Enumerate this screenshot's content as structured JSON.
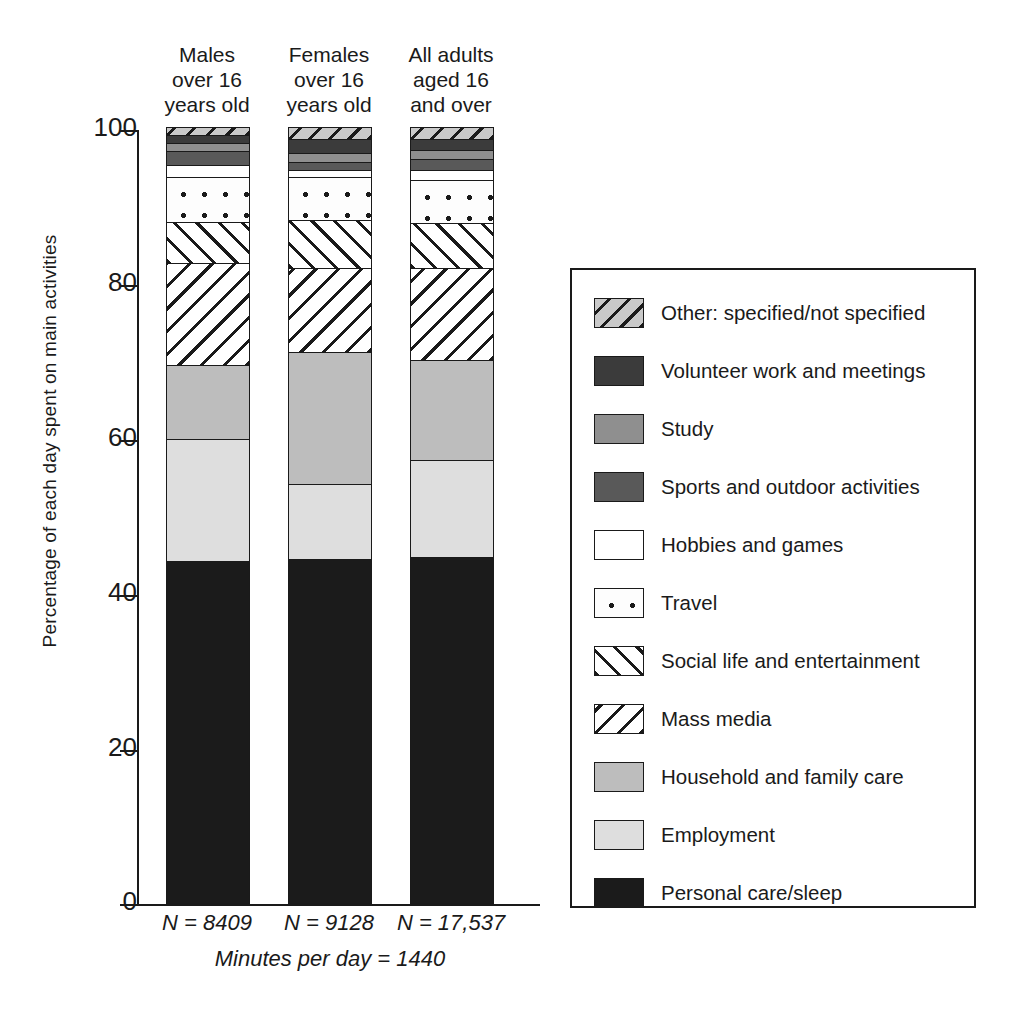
{
  "chart_data": {
    "type": "bar",
    "subtype": "stacked-percentage",
    "title": "",
    "xlabel": "",
    "ylabel": "Percentage of each day spent on main activities",
    "ylim": [
      0,
      100
    ],
    "yticks": [
      0,
      20,
      40,
      60,
      80,
      100
    ],
    "grid": false,
    "legend_position": "right",
    "categories": [
      "Males over 16 years old",
      "Females over 16 years old",
      "All adults aged 16 and over"
    ],
    "series": [
      {
        "name": "Personal care/sleep",
        "values": [
          44.0,
          44.3,
          44.5
        ]
      },
      {
        "name": "Employment",
        "values": [
          15.8,
          9.7,
          12.5
        ]
      },
      {
        "name": "Household and family care",
        "values": [
          9.5,
          17.0,
          13.0
        ]
      },
      {
        "name": "Mass media",
        "values": [
          13.2,
          10.8,
          11.8
        ]
      },
      {
        "name": "Social life and entertainment",
        "values": [
          5.3,
          6.2,
          5.8
        ]
      },
      {
        "name": "Travel",
        "values": [
          5.7,
          5.5,
          5.6
        ]
      },
      {
        "name": "Hobbies and games",
        "values": [
          1.6,
          1.0,
          1.3
        ]
      },
      {
        "name": "Sports and outdoor activities",
        "values": [
          1.8,
          1.0,
          1.4
        ]
      },
      {
        "name": "Study",
        "values": [
          1.0,
          1.2,
          1.1
        ]
      },
      {
        "name": "Volunteer work and meetings",
        "values": [
          1.1,
          1.8,
          1.5
        ]
      },
      {
        "name": "Other: specified/not specified",
        "values": [
          1.0,
          1.5,
          1.5
        ]
      }
    ]
  },
  "columns": [
    {
      "line1": "Males",
      "line2": "over 16",
      "line3": "years old",
      "n_label": "N = 8409"
    },
    {
      "line1": "Females",
      "line2": "over 16",
      "line3": "years old",
      "n_label": "N = 9128"
    },
    {
      "line1": "All adults",
      "line2": "aged 16",
      "line3": "and over",
      "n_label": "N = 17,537"
    }
  ],
  "axis": {
    "y_title": "Percentage of each day spent on main activities",
    "y_ticks": [
      "100",
      "80",
      "60",
      "40",
      "20",
      "0"
    ]
  },
  "footnote": "Minutes per day = 1440",
  "legend": {
    "items": [
      {
        "label": "Other: specified/not specified",
        "swatch": "back-hatch-gray-swatch"
      },
      {
        "label": "Volunteer work and meetings",
        "swatch": "dark-gray-swatch"
      },
      {
        "label": "Study",
        "swatch": "mid-gray-swatch"
      },
      {
        "label": "Sports and outdoor activities",
        "swatch": "medium-dark-gray-swatch"
      },
      {
        "label": "Hobbies and games",
        "swatch": "white-swatch"
      },
      {
        "label": "Travel",
        "swatch": "dotted-swatch"
      },
      {
        "label": "Social life and entertainment",
        "swatch": "forward-hatch-swatch"
      },
      {
        "label": "Mass media",
        "swatch": "back-hatch-swatch"
      },
      {
        "label": "Household and family care",
        "swatch": "light-gray-swatch"
      },
      {
        "label": "Employment",
        "swatch": "very-light-gray-swatch"
      },
      {
        "label": "Personal care/sleep",
        "swatch": "black-swatch"
      }
    ]
  },
  "colors": {
    "ink": "#1a1a1a",
    "personal_care": "#1b1b1b",
    "employment": "#dedede",
    "household": "#bdbdbd",
    "sports": "#595959",
    "study": "#8f8f8f",
    "volunteer": "#3b3b3b",
    "other": "#c9c9c9"
  }
}
